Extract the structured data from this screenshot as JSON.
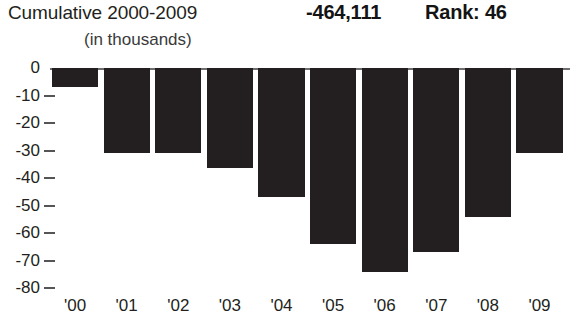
{
  "header": {
    "title": "Cumulative 2000-2009",
    "total_value": "-464,111",
    "rank_label": "Rank: 46",
    "units_note": "(in thousands)"
  },
  "colors": {
    "bar": "#231f20",
    "text": "#231f20",
    "axis": "#6f6f6f",
    "background": "#ffffff"
  },
  "chart_data": {
    "type": "bar",
    "title": "Cumulative 2000-2009",
    "subtitle": "(in thousands)",
    "xlabel": "",
    "ylabel": "",
    "categories": [
      "'00",
      "'01",
      "'02",
      "'03",
      "'04",
      "'05",
      "'06",
      "'07",
      "'08",
      "'09"
    ],
    "values": [
      -7,
      -31,
      -31,
      -36.5,
      -47,
      -64,
      -74,
      -67,
      -54,
      -31
    ],
    "ylim": [
      -80,
      0
    ],
    "ytick_labels": [
      "0",
      "-10",
      "-20",
      "-30",
      "-40",
      "-50",
      "-60",
      "-70",
      "-80"
    ],
    "ytick_values": [
      0,
      -10,
      -20,
      -30,
      -40,
      -50,
      -60,
      -70,
      -80
    ],
    "grid": false,
    "legend": null,
    "annotations": [
      {
        "text": "-464,111",
        "role": "cumulative-total"
      },
      {
        "text": "Rank: 46",
        "role": "rank"
      }
    ]
  }
}
